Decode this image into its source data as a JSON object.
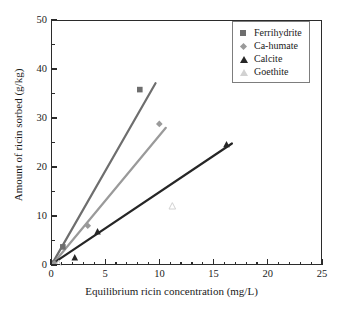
{
  "chart_data": {
    "type": "scatter",
    "title": "",
    "xlabel": "Equilibrium ricin concentration (mg/L)",
    "ylabel": "Amount of ricin sorbed (g/kg)",
    "xlim": [
      0,
      25
    ],
    "ylim": [
      0,
      50
    ],
    "xticks": [
      0,
      5,
      10,
      15,
      20,
      25
    ],
    "yticks": [
      0,
      10,
      20,
      30,
      40,
      50
    ],
    "xtick_labels": [
      "0",
      "5",
      "10",
      "15",
      "20",
      "25"
    ],
    "ytick_labels": [
      "0",
      "10",
      "20",
      "30",
      "40",
      "50"
    ],
    "x_minor_interval": 1,
    "y_minor_interval": 5,
    "grid": false,
    "legend_position": "top-right",
    "series": [
      {
        "name": "Ferrihydrite",
        "marker": "filled-square",
        "color": "#6e6e6e",
        "points": [
          [
            0.15,
            0.6
          ],
          [
            1.0,
            3.9
          ],
          [
            8.1,
            36.0
          ]
        ],
        "trendline": [
          [
            0.1,
            0.8
          ],
          [
            9.55,
            37.3
          ]
        ],
        "slope": 3.86
      },
      {
        "name": "Ca-humate",
        "marker": "filled-diamond",
        "color": "#9a9a9a",
        "points": [
          [
            0.2,
            0.5
          ],
          [
            3.3,
            8.2
          ],
          [
            9.9,
            29.0
          ]
        ],
        "trendline": [
          [
            0.15,
            0.6
          ],
          [
            10.5,
            28.2
          ]
        ],
        "slope": 2.67
      },
      {
        "name": "Calcite",
        "marker": "filled-triangle",
        "color": "#262626",
        "points": [
          [
            2.1,
            1.7
          ],
          [
            4.2,
            7.0
          ],
          [
            16.1,
            24.8
          ]
        ],
        "trendline": [
          [
            0.2,
            0.7
          ],
          [
            16.6,
            25.0
          ]
        ],
        "slope": 1.48
      },
      {
        "name": "Goethite",
        "marker": "open-triangle",
        "color": "#d2d2d2",
        "points": [
          [
            0.6,
            0.4
          ],
          [
            11.1,
            12.2
          ]
        ],
        "trendline": [],
        "slope": 1.1
      }
    ]
  },
  "legend": {
    "items": [
      {
        "label": "Ferrihydrite",
        "marker_name": "filled-square-marker"
      },
      {
        "label": "Ca-humate",
        "marker_name": "filled-diamond-marker"
      },
      {
        "label": "Calcite",
        "marker_name": "filled-triangle-marker"
      },
      {
        "label": "Goethite",
        "marker_name": "open-triangle-marker"
      }
    ]
  }
}
